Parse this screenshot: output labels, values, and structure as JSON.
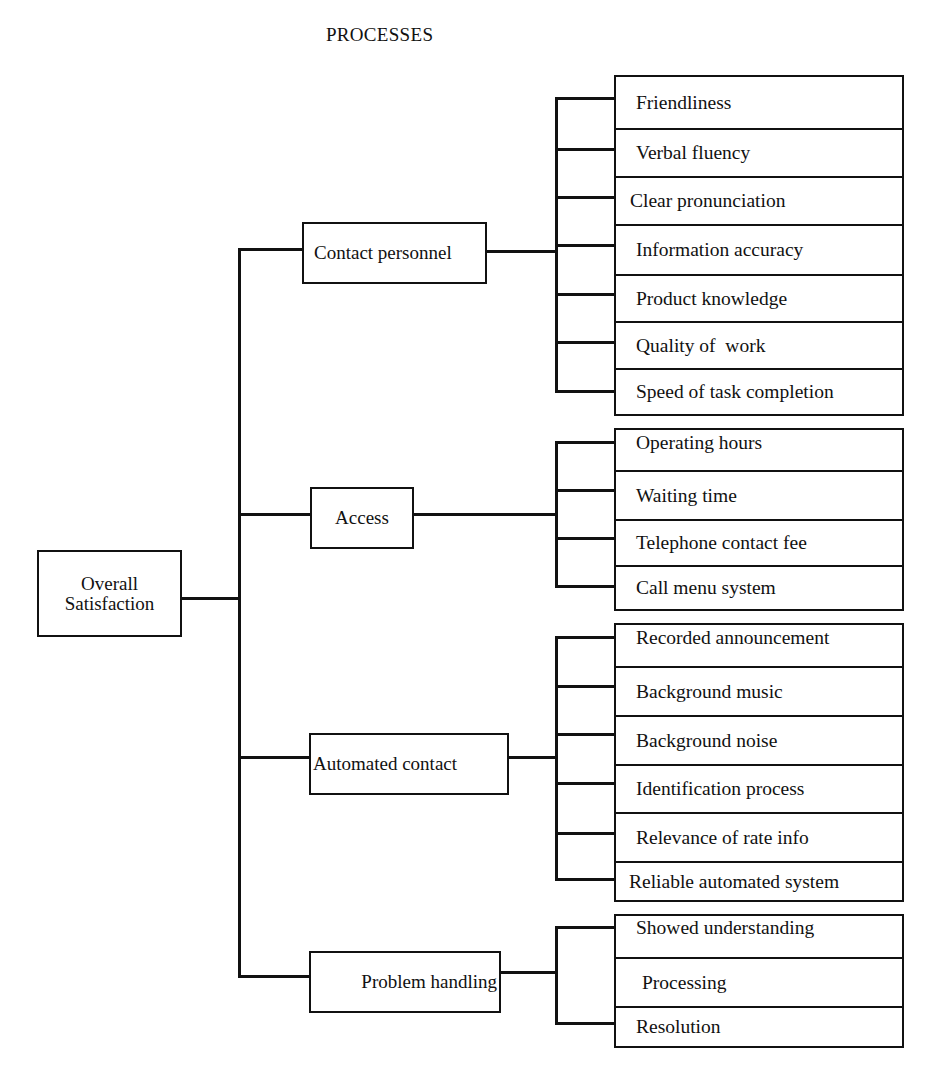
{
  "diagram": {
    "title": "PROCESSES",
    "root": {
      "label": "Overall Satisfaction",
      "lines": [
        "Overall",
        "Satisfaction"
      ]
    },
    "categories": [
      {
        "label": "Contact personnel",
        "items": [
          "Friendliness",
          "Verbal fluency",
          "Clear pronunciation",
          "Information accuracy",
          "Product knowledge",
          "Quality of  work",
          "Speed of task completion"
        ]
      },
      {
        "label": "Access",
        "items": [
          "Operating hours",
          "Waiting time",
          "Telephone contact fee",
          "Call menu system"
        ]
      },
      {
        "label": "Automated contact",
        "items": [
          "Recorded announcement",
          "Background music",
          "Background noise",
          "Identification process",
          "Relevance of rate info",
          "Reliable automated system"
        ]
      },
      {
        "label": "Problem handling",
        "items": [
          "Showed understanding",
          "Processing",
          "Resolution"
        ]
      }
    ]
  }
}
